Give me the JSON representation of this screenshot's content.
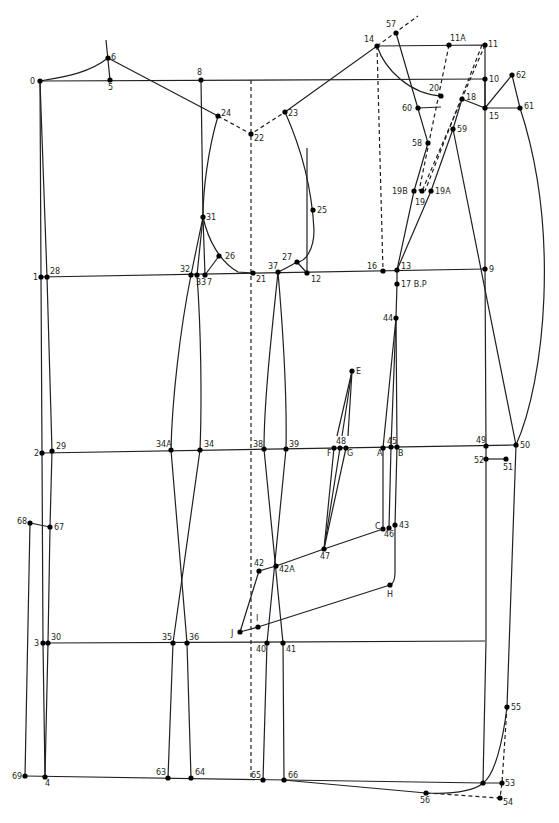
{
  "diagram": {
    "type": "pattern-draft",
    "colors": {
      "line": "#231f20",
      "point": "#000000",
      "background": "#ffffff"
    },
    "points": [
      {
        "id": "0",
        "x": 40,
        "y": 81,
        "lx": 30,
        "ly": 84
      },
      {
        "id": "5",
        "x": 110,
        "y": 80,
        "lx": 108,
        "ly": 90
      },
      {
        "id": "6",
        "x": 108,
        "y": 58,
        "lx": 111,
        "ly": 60
      },
      {
        "id": "8",
        "x": 201,
        "y": 80,
        "lx": 197,
        "ly": 75
      },
      {
        "id": "24",
        "x": 218,
        "y": 116,
        "lx": 221,
        "ly": 116
      },
      {
        "id": "22",
        "x": 251,
        "y": 134,
        "lx": 254,
        "ly": 141
      },
      {
        "id": "23",
        "x": 285,
        "y": 112,
        "lx": 288,
        "ly": 116
      },
      {
        "id": "14",
        "x": 377,
        "y": 46,
        "lx": 364,
        "ly": 42
      },
      {
        "id": "57",
        "x": 396,
        "y": 33,
        "lx": 386,
        "ly": 27
      },
      {
        "id": "11A",
        "x": 449,
        "y": 45,
        "lx": 450,
        "ly": 41
      },
      {
        "id": "11",
        "x": 485,
        "y": 45,
        "lx": 488,
        "ly": 47
      },
      {
        "id": "10",
        "x": 485,
        "y": 79,
        "lx": 489,
        "ly": 82
      },
      {
        "id": "62",
        "x": 512,
        "y": 75,
        "lx": 516,
        "ly": 78
      },
      {
        "id": "20",
        "x": 441,
        "y": 96,
        "lx": 429,
        "ly": 91
      },
      {
        "id": "18",
        "x": 462,
        "y": 99,
        "lx": 466,
        "ly": 100
      },
      {
        "id": "60",
        "x": 418,
        "y": 108,
        "lx": 402,
        "ly": 111
      },
      {
        "id": "15",
        "x": 485,
        "y": 108,
        "lx": 489,
        "ly": 119
      },
      {
        "id": "61",
        "x": 520,
        "y": 108,
        "lx": 524,
        "ly": 109
      },
      {
        "id": "59",
        "x": 453,
        "y": 129,
        "lx": 457,
        "ly": 132
      },
      {
        "id": "58",
        "x": 428,
        "y": 143,
        "lx": 412,
        "ly": 146
      },
      {
        "id": "19B",
        "x": 414,
        "y": 191,
        "lx": 392,
        "ly": 194
      },
      {
        "id": "19",
        "x": 422,
        "y": 191,
        "lx": 415,
        "ly": 205
      },
      {
        "id": "19A",
        "x": 431,
        "y": 191,
        "lx": 435,
        "ly": 194
      },
      {
        "id": "25",
        "x": 313,
        "y": 210,
        "lx": 317,
        "ly": 213
      },
      {
        "id": "31",
        "x": 203,
        "y": 217,
        "lx": 206,
        "ly": 220
      },
      {
        "id": "26",
        "x": 219,
        "y": 256,
        "lx": 225,
        "ly": 259
      },
      {
        "id": "27",
        "x": 297,
        "y": 262,
        "lx": 282,
        "ly": 260
      },
      {
        "id": "1",
        "x": 41,
        "y": 277,
        "lx": 33,
        "ly": 280
      },
      {
        "id": "28",
        "x": 47,
        "y": 277,
        "lx": 50,
        "ly": 274
      },
      {
        "id": "32",
        "x": 191,
        "y": 275,
        "lx": 180,
        "ly": 272
      },
      {
        "id": "33",
        "x": 197,
        "y": 275,
        "lx": 196,
        "ly": 285
      },
      {
        "id": "7",
        "x": 205,
        "y": 275,
        "lx": 207,
        "ly": 285
      },
      {
        "id": "21",
        "x": 253,
        "y": 273,
        "lx": 256,
        "ly": 282
      },
      {
        "id": "37",
        "x": 278,
        "y": 272,
        "lx": 268,
        "ly": 269
      },
      {
        "id": "12",
        "x": 307,
        "y": 273,
        "lx": 311,
        "ly": 282
      },
      {
        "id": "16",
        "x": 383,
        "y": 271,
        "lx": 367,
        "ly": 269
      },
      {
        "id": "13",
        "x": 397,
        "y": 270,
        "lx": 401,
        "ly": 269
      },
      {
        "id": "9",
        "x": 485,
        "y": 269,
        "lx": 489,
        "ly": 272
      },
      {
        "id": "17 B.P",
        "x": 397,
        "y": 284,
        "lx": 401,
        "ly": 287
      },
      {
        "id": "44",
        "x": 396,
        "y": 318,
        "lx": 383,
        "ly": 321
      },
      {
        "id": "E",
        "x": 352,
        "y": 371,
        "lx": 356,
        "ly": 374
      },
      {
        "id": "48",
        "x": 340,
        "y": 448,
        "lx": 336,
        "ly": 444
      },
      {
        "id": "F",
        "x": 334,
        "y": 448,
        "lx": 327,
        "ly": 456
      },
      {
        "id": "G",
        "x": 346,
        "y": 448,
        "lx": 347,
        "ly": 456
      },
      {
        "id": "A",
        "x": 383,
        "y": 448,
        "lx": 377,
        "ly": 456
      },
      {
        "id": "45",
        "x": 391,
        "y": 447,
        "lx": 387,
        "ly": 444
      },
      {
        "id": "B",
        "x": 397,
        "y": 447,
        "lx": 398,
        "ly": 456
      },
      {
        "id": "49",
        "x": 486,
        "y": 446,
        "lx": 476,
        "ly": 443
      },
      {
        "id": "50",
        "x": 516,
        "y": 445,
        "lx": 520,
        "ly": 448
      },
      {
        "id": "52",
        "x": 486,
        "y": 459,
        "lx": 474,
        "ly": 463
      },
      {
        "id": "51",
        "x": 506,
        "y": 459,
        "lx": 503,
        "ly": 470
      },
      {
        "id": "2",
        "x": 42,
        "y": 453,
        "lx": 34,
        "ly": 456
      },
      {
        "id": "29",
        "x": 52,
        "y": 451,
        "lx": 56,
        "ly": 449
      },
      {
        "id": "34A",
        "x": 171,
        "y": 450,
        "lx": 156,
        "ly": 447
      },
      {
        "id": "34",
        "x": 200,
        "y": 450,
        "lx": 204,
        "ly": 447
      },
      {
        "id": "38",
        "x": 264,
        "y": 449,
        "lx": 253,
        "ly": 447
      },
      {
        "id": "39",
        "x": 286,
        "y": 449,
        "lx": 289,
        "ly": 447
      },
      {
        "id": "68",
        "x": 30,
        "y": 523,
        "lx": 17,
        "ly": 524
      },
      {
        "id": "67",
        "x": 50,
        "y": 527,
        "lx": 54,
        "ly": 530
      },
      {
        "id": "C",
        "x": 383,
        "y": 529,
        "lx": 375,
        "ly": 529
      },
      {
        "id": "46",
        "x": 389,
        "y": 528,
        "lx": 384,
        "ly": 537
      },
      {
        "id": "43",
        "x": 395,
        "y": 525,
        "lx": 399,
        "ly": 528
      },
      {
        "id": "47",
        "x": 324,
        "y": 549,
        "lx": 320,
        "ly": 559
      },
      {
        "id": "42",
        "x": 259,
        "y": 571,
        "lx": 254,
        "ly": 566
      },
      {
        "id": "42A",
        "x": 276,
        "y": 566,
        "lx": 279,
        "ly": 572
      },
      {
        "id": "H",
        "x": 390,
        "y": 585,
        "lx": 387,
        "ly": 597
      },
      {
        "id": "I",
        "x": 258,
        "y": 627,
        "lx": 256,
        "ly": 621
      },
      {
        "id": "J",
        "x": 240,
        "y": 632,
        "lx": 231,
        "ly": 636
      },
      {
        "id": "3",
        "x": 43,
        "y": 643,
        "lx": 34,
        "ly": 646
      },
      {
        "id": "30",
        "x": 48,
        "y": 643,
        "lx": 51,
        "ly": 640
      },
      {
        "id": "35",
        "x": 173,
        "y": 643,
        "lx": 162,
        "ly": 640
      },
      {
        "id": "36",
        "x": 187,
        "y": 643,
        "lx": 189,
        "ly": 640
      },
      {
        "id": "40",
        "x": 267,
        "y": 643,
        "lx": 256,
        "ly": 652
      },
      {
        "id": "41",
        "x": 283,
        "y": 643,
        "lx": 286,
        "ly": 652
      },
      {
        "id": "55",
        "x": 507,
        "y": 707,
        "lx": 511,
        "ly": 710
      },
      {
        "id": "69",
        "x": 25,
        "y": 776,
        "lx": 12,
        "ly": 779
      },
      {
        "id": "4",
        "x": 45,
        "y": 777,
        "lx": 45,
        "ly": 786
      },
      {
        "id": "63",
        "x": 168,
        "y": 778,
        "lx": 156,
        "ly": 775
      },
      {
        "id": "64",
        "x": 191,
        "y": 778,
        "lx": 195,
        "ly": 775
      },
      {
        "id": "65",
        "x": 263,
        "y": 780,
        "lx": 251,
        "ly": 778
      },
      {
        "id": "66",
        "x": 284,
        "y": 780,
        "lx": 288,
        "ly": 778
      },
      {
        "id": "56",
        "x": 426,
        "y": 793,
        "lx": 420,
        "ly": 803
      },
      {
        "id": "53x",
        "x": 483,
        "y": 783,
        "lx": -100,
        "ly": -100
      },
      {
        "id": "53",
        "x": 502,
        "y": 783,
        "lx": 505,
        "ly": 786
      },
      {
        "id": "54",
        "x": 500,
        "y": 798,
        "lx": 503,
        "ly": 805
      }
    ],
    "lines": [
      {
        "d": "M40 81 L485 79"
      },
      {
        "d": "M40 81 C70 76 90 72 108 58"
      },
      {
        "d": "M106 40 L110 80"
      },
      {
        "d": "M108 58 L218 116"
      },
      {
        "d": "M201 80 L203 217 L205 275"
      },
      {
        "d": "M218 116 C208 150 203 190 203 217"
      },
      {
        "d": "M203 217 C208 240 220 262 238 272 L253 273"
      },
      {
        "d": "M205 275 L219 256"
      },
      {
        "d": "M285 112 L377 46 L485 45 L485 108"
      },
      {
        "d": "M285 112 C302 150 312 190 314 230 C314 250 305 262 297 262 C290 266 283 270 278 272"
      },
      {
        "d": "M307 148 L307 273"
      },
      {
        "d": "M297 262 L307 273"
      },
      {
        "d": "M40 81 L41 277 L42 453 L43 643 L45 777"
      },
      {
        "d": "M40 81 L47 277 L52 451 L50 527 L48 643 L45 777"
      },
      {
        "d": "M41 277 L485 269"
      },
      {
        "d": "M42 453 L516 445"
      },
      {
        "d": "M43 643 L485 641"
      },
      {
        "d": "M25 776 L483 783 L502 783"
      },
      {
        "d": "M30 523 L50 527"
      },
      {
        "d": "M30 523 L25 776"
      },
      {
        "d": "M377 46 C385 70 410 94 441 96"
      },
      {
        "d": "M396 33 L428 143 L414 191 L397 270"
      },
      {
        "d": "M418 108 L441 107"
      },
      {
        "d": "M462 99 L485 108 L512 75 L520 108"
      },
      {
        "d": "M485 108 L520 108"
      },
      {
        "d": "M462 99 L453 129 L431 191 L397 270"
      },
      {
        "d": "M453 129 L516 445"
      },
      {
        "d": "M520 108 C560 230 545 380 516 445"
      },
      {
        "d": "M516 445 L507 707 C503 740 495 775 483 783"
      },
      {
        "d": "M485 79 L485 269 L486 446 L486 641 L483 783"
      },
      {
        "d": "M486 459 L506 459"
      },
      {
        "d": "M203 217 L191 275"
      },
      {
        "d": "M203 217 L197 275"
      },
      {
        "d": "M191 275 C180 330 172 400 171 450 L187 643 L191 778"
      },
      {
        "d": "M197 275 C201 330 202 400 200 450 L173 643 L168 778"
      },
      {
        "d": "M278 272 C272 330 264 400 264 449 L283 643 L284 780"
      },
      {
        "d": "M278 272 C283 330 287 400 286 449 L267 643 L263 780"
      },
      {
        "d": "M397 270 L397 284 L396 318"
      },
      {
        "d": "M396 318 L383 448 L383 529"
      },
      {
        "d": "M396 318 L391 447 L389 528"
      },
      {
        "d": "M396 318 L397 447 L395 525 L395 572 C395 580 393 584 390 585"
      },
      {
        "d": "M352 371 L337 436"
      },
      {
        "d": "M352 371 L342 436"
      },
      {
        "d": "M352 371 L348 436"
      },
      {
        "d": "M334 448 L324 549"
      },
      {
        "d": "M340 448 L324 549"
      },
      {
        "d": "M346 448 L324 549"
      },
      {
        "d": "M324 549 L383 529"
      },
      {
        "d": "M324 549 L276 566 L259 571 L240 632 L258 627 L390 585"
      },
      {
        "d": "M283 780 L426 793 C460 795 478 788 483 783"
      }
    ],
    "dashed_lines": [
      {
        "d": "M218 116 L251 134 L285 112"
      },
      {
        "d": "M251 80 L251 780"
      },
      {
        "d": "M377 46 L383 271"
      },
      {
        "d": "M377 46 L418 16"
      },
      {
        "d": "M449 45 L419 191"
      },
      {
        "d": "M485 45 L422 191"
      },
      {
        "d": "M482 45 L425 191"
      },
      {
        "d": "M507 707 L502 783 L500 798 L426 793"
      }
    ]
  }
}
